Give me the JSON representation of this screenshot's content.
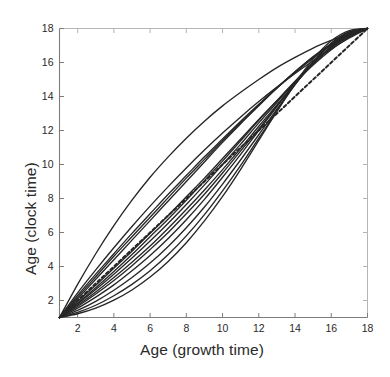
{
  "figure": {
    "background": "#ffffff",
    "line_color": "#262626",
    "axis_color": "#7d7d7d",
    "dashed_color": "#262626"
  },
  "labels": {
    "xlabel": "Age (growth time)",
    "ylabel": "Age (clock time)"
  },
  "chart_data": {
    "type": "line",
    "title": "",
    "xlabel": "Age (growth time)",
    "ylabel": "Age (clock time)",
    "xlim": [
      1,
      18
    ],
    "ylim": [
      1,
      18
    ],
    "xticks": [
      2,
      4,
      6,
      8,
      10,
      12,
      14,
      16,
      18
    ],
    "yticks": [
      2,
      4,
      6,
      8,
      10,
      12,
      14,
      16,
      18
    ],
    "xticklabels": [
      "2",
      "4",
      "6",
      "8",
      "10",
      "12",
      "14",
      "16",
      "18"
    ],
    "yticklabels": [
      "2",
      "4",
      "6",
      "8",
      "10",
      "12",
      "14",
      "16",
      "18"
    ],
    "grid": false,
    "legend": false,
    "legend_position": "none",
    "x": [
      1,
      2,
      3,
      4,
      5,
      6,
      7,
      8,
      9,
      10,
      11,
      12,
      13,
      14,
      15,
      16,
      17,
      18
    ],
    "series": [
      {
        "name": "warp-1",
        "style": "solid",
        "values": [
          1.0,
          2.95,
          4.75,
          6.4,
          7.9,
          9.25,
          10.45,
          11.55,
          12.55,
          13.45,
          14.25,
          15.0,
          15.7,
          16.3,
          16.85,
          17.3,
          17.7,
          18.0
        ]
      },
      {
        "name": "warp-2",
        "style": "solid",
        "values": [
          1.0,
          2.45,
          3.8,
          5.1,
          6.35,
          7.55,
          8.7,
          9.8,
          10.85,
          11.85,
          12.8,
          13.7,
          14.55,
          15.35,
          16.1,
          16.8,
          17.45,
          18.0
        ]
      },
      {
        "name": "warp-3",
        "style": "solid",
        "values": [
          1.0,
          2.3,
          3.55,
          4.75,
          5.95,
          7.1,
          8.25,
          9.35,
          10.45,
          11.5,
          12.55,
          13.55,
          14.5,
          15.4,
          16.25,
          17.0,
          17.6,
          18.0
        ]
      },
      {
        "name": "warp-4",
        "style": "solid",
        "values": [
          1.0,
          2.2,
          3.4,
          4.6,
          5.75,
          6.9,
          8.05,
          9.2,
          10.3,
          11.4,
          12.45,
          13.5,
          14.5,
          15.45,
          16.3,
          17.05,
          17.65,
          18.0
        ]
      },
      {
        "name": "warp-5",
        "style": "solid",
        "values": [
          1.0,
          2.1,
          3.25,
          4.4,
          5.55,
          6.7,
          7.85,
          9.0,
          10.15,
          11.3,
          12.4,
          13.45,
          14.5,
          15.45,
          16.35,
          17.1,
          17.7,
          18.0
        ]
      },
      {
        "name": "warp-6-mean-dashed",
        "style": "dashed",
        "values": [
          1.0,
          2.0,
          3.0,
          4.0,
          5.0,
          6.0,
          7.0,
          8.0,
          9.0,
          10.0,
          11.0,
          12.0,
          13.0,
          14.0,
          15.0,
          16.0,
          17.0,
          18.0
        ]
      },
      {
        "name": "warp-7",
        "style": "solid",
        "values": [
          1.0,
          1.95,
          2.9,
          3.9,
          4.9,
          5.95,
          7.0,
          8.1,
          9.2,
          10.35,
          11.5,
          12.65,
          13.75,
          14.85,
          15.85,
          16.75,
          17.5,
          18.0
        ]
      },
      {
        "name": "warp-8",
        "style": "solid",
        "values": [
          1.0,
          1.85,
          2.75,
          3.7,
          4.7,
          5.75,
          6.8,
          7.9,
          9.05,
          10.2,
          11.4,
          12.6,
          13.75,
          14.9,
          15.95,
          16.85,
          17.55,
          18.0
        ]
      },
      {
        "name": "warp-9",
        "style": "solid",
        "values": [
          1.0,
          1.8,
          2.65,
          3.55,
          4.5,
          5.5,
          6.55,
          7.65,
          8.8,
          10.0,
          11.2,
          12.45,
          13.65,
          14.85,
          15.95,
          16.9,
          17.6,
          18.0
        ]
      },
      {
        "name": "warp-10",
        "style": "solid",
        "values": [
          1.0,
          1.72,
          2.5,
          3.35,
          4.25,
          5.2,
          6.25,
          7.35,
          8.5,
          9.7,
          10.95,
          12.25,
          13.5,
          14.75,
          15.9,
          16.9,
          17.65,
          18.0
        ]
      },
      {
        "name": "warp-11",
        "style": "solid",
        "values": [
          1.0,
          1.65,
          2.38,
          3.18,
          4.05,
          5.0,
          6.0,
          7.1,
          8.25,
          9.5,
          10.8,
          12.1,
          13.45,
          14.75,
          15.95,
          16.95,
          17.7,
          18.0
        ]
      },
      {
        "name": "warp-12",
        "style": "solid",
        "values": [
          1.0,
          1.55,
          2.2,
          2.92,
          3.75,
          4.65,
          5.65,
          6.75,
          7.95,
          9.25,
          10.6,
          12.0,
          13.4,
          14.8,
          16.05,
          17.1,
          17.75,
          18.0
        ]
      },
      {
        "name": "warp-13",
        "style": "solid",
        "values": [
          1.0,
          1.42,
          1.95,
          2.6,
          3.35,
          4.2,
          5.18,
          6.28,
          7.5,
          8.85,
          10.28,
          11.75,
          13.25,
          14.7,
          16.0,
          17.1,
          17.78,
          18.0
        ]
      },
      {
        "name": "warp-14",
        "style": "solid",
        "values": [
          1.0,
          1.3,
          1.72,
          2.28,
          2.95,
          3.75,
          4.7,
          5.8,
          7.05,
          8.45,
          9.95,
          11.55,
          13.15,
          14.7,
          16.05,
          17.15,
          17.82,
          18.0
        ]
      },
      {
        "name": "warp-15",
        "style": "solid",
        "values": [
          1.0,
          1.22,
          1.55,
          2.02,
          2.62,
          3.38,
          4.3,
          5.4,
          6.68,
          8.12,
          9.72,
          11.42,
          13.12,
          14.78,
          16.2,
          17.28,
          17.88,
          18.0
        ]
      }
    ]
  }
}
